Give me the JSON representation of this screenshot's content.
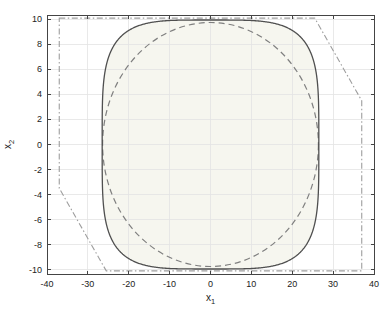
{
  "figure": {
    "background": "#ffffff"
  },
  "chart_data": {
    "type": "line",
    "title": "",
    "xlabel": "x_1",
    "ylabel": "x_2",
    "xlim": [
      -40,
      40
    ],
    "ylim": [
      -10.35,
      10.35
    ],
    "xticks": [
      -40,
      -30,
      -20,
      -10,
      0,
      10,
      20,
      30,
      40
    ],
    "yticks": [
      -10,
      -8,
      -6,
      -4,
      -2,
      0,
      2,
      4,
      6,
      8,
      10
    ],
    "grid": true,
    "grid_color": "#e4e4e4",
    "axis_color": "#444444",
    "tick_label_color": "#222222",
    "tick_font_size": 9,
    "legend": "none",
    "series": [
      {
        "name": "constraint-polytope",
        "type": "polygon",
        "style": "dashdot",
        "color": "#9e9e9e",
        "line_width": 1.1,
        "dash": [
          6,
          2.5,
          1.5,
          2.5
        ],
        "vertices": [
          [
            -37,
            10.1
          ],
          [
            25.5,
            10.1
          ],
          [
            37,
            3.5
          ],
          [
            37,
            -10.1
          ],
          [
            -25.5,
            -10.1
          ],
          [
            -37,
            -3.5
          ]
        ]
      },
      {
        "name": "invariant-ellipsoid",
        "type": "ellipse",
        "style": "dashed",
        "color": "#7f7f7f",
        "line_width": 1.2,
        "dash": [
          6,
          4
        ],
        "center": [
          0,
          0
        ],
        "semi_axis_x": 26.4,
        "semi_axis_y": 9.75
      },
      {
        "name": "maximal-invariant-set-boundary",
        "type": "superellipse",
        "style": "solid",
        "color": "#4f4f4f",
        "line_width": 1.3,
        "center": [
          0,
          0
        ],
        "semi_axis_x": 26.5,
        "semi_axis_y": 9.95,
        "exponent": 4.2,
        "fill_color": "#f6f6ef",
        "x_extent": [
          -26.5,
          26.5
        ],
        "y_extent": [
          -9.95,
          9.95
        ]
      }
    ]
  }
}
